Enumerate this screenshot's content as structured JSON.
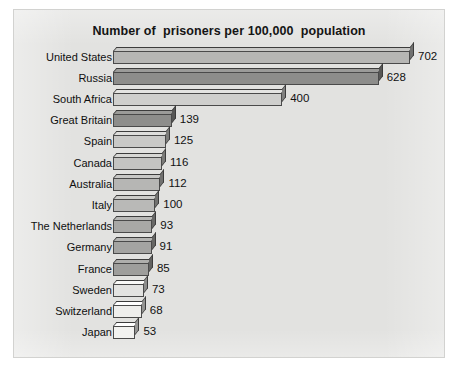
{
  "chart_data": {
    "type": "bar",
    "orientation": "horizontal",
    "title": "Number of  prisoners per 100,000  population",
    "xlabel": "",
    "ylabel": "",
    "grid": false,
    "legend": null,
    "xlim": [
      0,
      702
    ],
    "categories": [
      "United States",
      "Russia",
      "South Africa",
      "Great Britain",
      "Spain",
      "Canada",
      "Australia",
      "Italy",
      "The Netherlands",
      "Germany",
      "France",
      "Sweden",
      "Switzerland",
      "Japan"
    ],
    "values": [
      702,
      628,
      400,
      139,
      125,
      116,
      112,
      100,
      93,
      91,
      85,
      73,
      68,
      53
    ],
    "data_labels": [
      "702",
      "628",
      "400",
      "139",
      "125",
      "116",
      "112",
      "100",
      "93",
      "91",
      "85",
      "73",
      "68",
      "53"
    ],
    "bar_colors": [
      "#b6b6b4",
      "#8d8d8b",
      "#cfcfcd",
      "#8d8d8b",
      "#c9c9c7",
      "#c4c4c2",
      "#b6b6b4",
      "#b9b9b7",
      "#a8a8a6",
      "#a4a4a2",
      "#9e9e9c",
      "#e3e3e1",
      "#eeeeec",
      "#f2f2f0"
    ]
  },
  "style": {
    "panel_background": "#e2e2e0",
    "page_background": "#ffffff",
    "text_color": "#111111",
    "bar_outline": "#4a4a4a"
  }
}
